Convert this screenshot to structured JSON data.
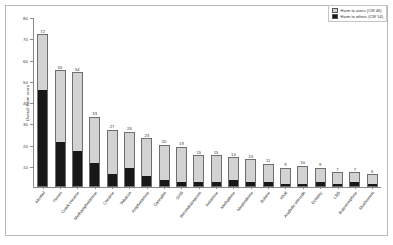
{
  "chart_data": {
    "type": "bar",
    "title": "",
    "subtitle": "",
    "xlabel": "",
    "ylabel": "Overall harm score",
    "ylim": [
      0,
      80
    ],
    "yticks": [
      10,
      20,
      30,
      40,
      50,
      60,
      70,
      80
    ],
    "grid": false,
    "stacked": true,
    "legend_position": "top-right",
    "legend": [
      {
        "name": "Harm to users (CW 46)",
        "color": "#d2d2d2"
      },
      {
        "name": "Harm to others (CW 54)",
        "color": "#17181a"
      }
    ],
    "categories": [
      "Alcohol",
      "Heroin",
      "Crack cocaine",
      "Methamphetamine",
      "Cocaine",
      "Tobacco",
      "Amphetamine",
      "Cannabis",
      "GHB",
      "Benzodiazepines",
      "Ketamine",
      "Methadone",
      "Mephedrone",
      "Butane",
      "Khat",
      "Anabolic steroids",
      "Ecstasy",
      "LSD",
      "Buprenorphine",
      "Mushrooms"
    ],
    "series": [
      {
        "name": "Harm to others (CW 54)",
        "color": "#17181a",
        "values": [
          46,
          21,
          17,
          11,
          6,
          9,
          5,
          3,
          2,
          2,
          2,
          3,
          2,
          2,
          1,
          1,
          2,
          1,
          2,
          1
        ]
      },
      {
        "name": "Harm to users (CW 46)",
        "color": "#d2d2d2",
        "values": [
          26,
          34,
          37,
          22,
          21,
          17,
          18,
          17,
          17,
          13,
          13,
          11,
          11,
          9,
          8,
          9,
          7,
          6,
          5,
          5
        ]
      }
    ],
    "totals": [
      72,
      55,
      54,
      33,
      27,
      26,
      23,
      20,
      19,
      15,
      15,
      14,
      13,
      11,
      9,
      10,
      9,
      7,
      7,
      6
    ]
  }
}
